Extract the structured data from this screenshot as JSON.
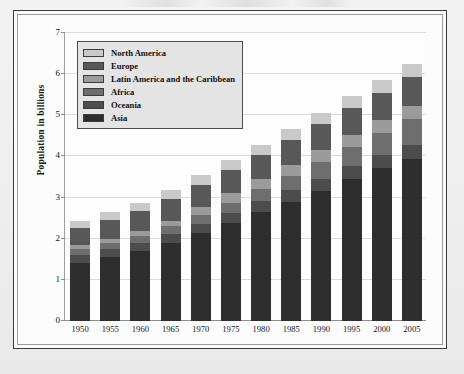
{
  "figure": {
    "frame_style": "double-rule-box",
    "page_background": "#efefef"
  },
  "chart_data": {
    "type": "bar",
    "subtype": "stacked-bar",
    "title": "",
    "xlabel": "",
    "ylabel": "Population in billions",
    "categories": [
      "1950",
      "1955",
      "1960",
      "1965",
      "1970",
      "1975",
      "1980",
      "1985",
      "1990",
      "1995",
      "2000",
      "2005"
    ],
    "ylim": [
      0,
      7
    ],
    "yticks": [
      0,
      1,
      2,
      3,
      4,
      5,
      6,
      7
    ],
    "ytick_labels": [
      "0",
      "1",
      "2",
      "3",
      "4",
      "5",
      "6",
      "7"
    ],
    "grid": true,
    "grid_axis": "y",
    "legend_position": "upper-left-inside",
    "stack_order_bottom_to_top": [
      "Asia",
      "Oceania",
      "Africa",
      "Latin America and the Caribbean",
      "Europe",
      "North America"
    ],
    "series": [
      {
        "name": "Asia",
        "color": "#2e2e2e",
        "values": [
          1.42,
          1.56,
          1.7,
          1.9,
          2.14,
          2.38,
          2.64,
          2.9,
          3.17,
          3.46,
          3.72,
          3.95
        ]
      },
      {
        "name": "Oceania",
        "color": "#4c4c4c",
        "values": [
          0.19,
          0.19,
          0.2,
          0.22,
          0.23,
          0.25,
          0.27,
          0.28,
          0.29,
          0.3,
          0.31,
          0.33
        ]
      },
      {
        "name": "Africa",
        "color": "#6e6e6e",
        "values": [
          0.13,
          0.14,
          0.16,
          0.18,
          0.21,
          0.25,
          0.29,
          0.34,
          0.41,
          0.47,
          0.54,
          0.62
        ]
      },
      {
        "name": "Latin America and the Caribbean",
        "color": "#9b9b9b",
        "values": [
          0.1,
          0.11,
          0.12,
          0.14,
          0.18,
          0.22,
          0.25,
          0.27,
          0.29,
          0.3,
          0.31,
          0.33
        ]
      },
      {
        "name": "Europe",
        "color": "#585858",
        "values": [
          0.42,
          0.45,
          0.49,
          0.53,
          0.55,
          0.57,
          0.58,
          0.6,
          0.62,
          0.65,
          0.67,
          0.7
        ]
      },
      {
        "name": "North America",
        "color": "#c9c9c9",
        "values": [
          0.17,
          0.19,
          0.21,
          0.22,
          0.24,
          0.25,
          0.26,
          0.27,
          0.28,
          0.29,
          0.3,
          0.31
        ]
      }
    ],
    "totals": [
      2.43,
      2.74,
      2.98,
      3.29,
      3.65,
      3.92,
      4.29,
      4.66,
      5.06,
      5.47,
      5.85,
      6.24
    ]
  },
  "legend": {
    "items": [
      {
        "label": "North America",
        "color": "#c9c9c9"
      },
      {
        "label": "Europe",
        "color": "#585858"
      },
      {
        "label": "Latin America and the Caribbean",
        "color": "#9b9b9b"
      },
      {
        "label": "Africa",
        "color": "#6e6e6e"
      },
      {
        "label": "Oceania",
        "color": "#4c4c4c"
      },
      {
        "label": "Asia",
        "color": "#2e2e2e"
      }
    ]
  }
}
